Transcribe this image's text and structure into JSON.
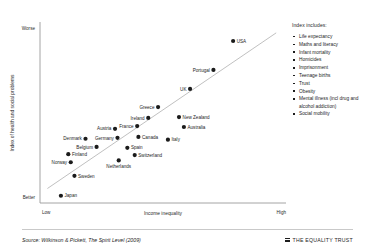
{
  "chart_data": {
    "type": "scatter",
    "title": "",
    "xlabel": "Income inequality",
    "ylabel": "Index of health and social problems",
    "x_tick_labels": [
      "Low",
      "High"
    ],
    "y_tick_labels": [
      "Worse",
      "Better"
    ],
    "grid": false,
    "legend_position": "right",
    "xlim": [
      0,
      100
    ],
    "ylim": [
      0,
      100
    ],
    "trendline": {
      "x0": 3,
      "y0": 8,
      "x1": 96,
      "y1": 94
    },
    "points": [
      {
        "name": "USA",
        "x": 78.5,
        "y": 89.5,
        "label_side": "right"
      },
      {
        "name": "Portugal",
        "x": 70.5,
        "y": 73.5,
        "label_side": "left"
      },
      {
        "name": "UK",
        "x": 61.0,
        "y": 63.0,
        "label_side": "left"
      },
      {
        "name": "Greece",
        "x": 48.0,
        "y": 53.0,
        "label_side": "left"
      },
      {
        "name": "New Zealand",
        "x": 56.5,
        "y": 47.5,
        "label_side": "right"
      },
      {
        "name": "Ireland",
        "x": 44.0,
        "y": 47.0,
        "label_side": "left"
      },
      {
        "name": "Australia",
        "x": 58.5,
        "y": 42.0,
        "label_side": "right"
      },
      {
        "name": "Austria",
        "x": 30.5,
        "y": 41.0,
        "label_side": "left"
      },
      {
        "name": "France",
        "x": 39.5,
        "y": 42.5,
        "label_side": "left"
      },
      {
        "name": "Canada",
        "x": 40.0,
        "y": 36.5,
        "label_side": "right"
      },
      {
        "name": "Germany",
        "x": 31.5,
        "y": 36.0,
        "label_side": "left"
      },
      {
        "name": "Denmark",
        "x": 18.5,
        "y": 35.5,
        "label_side": "left"
      },
      {
        "name": "Italy",
        "x": 52.0,
        "y": 35.0,
        "label_side": "right"
      },
      {
        "name": "Belgium",
        "x": 23.0,
        "y": 31.0,
        "label_side": "left"
      },
      {
        "name": "Spain",
        "x": 35.5,
        "y": 30.5,
        "label_side": "right"
      },
      {
        "name": "Switzerland",
        "x": 38.5,
        "y": 26.5,
        "label_side": "right"
      },
      {
        "name": "Finland",
        "x": 11.5,
        "y": 27.0,
        "label_side": "right"
      },
      {
        "name": "Netherlands",
        "x": 32.0,
        "y": 23.5,
        "label_side": "below"
      },
      {
        "name": "Norway",
        "x": 12.5,
        "y": 22.5,
        "label_side": "left"
      },
      {
        "name": "Sweden",
        "x": 14.0,
        "y": 15.0,
        "label_side": "right"
      },
      {
        "name": "Japan",
        "x": 8.5,
        "y": 4.0,
        "label_side": "right"
      }
    ]
  },
  "legend": {
    "title": "Index includes:",
    "items": [
      "Life expectancy",
      "Maths and literacy",
      "Infant mortality",
      "Homicides",
      "Imprisonment",
      "Teenage births",
      "Trust",
      "Obesity",
      "Mental illness (incl drug and alcohol addiction)",
      "Social mobility"
    ]
  },
  "footer": {
    "source": "Source: Wilkinson & Pickett, The Spirit Level (2009)",
    "brand": "THE EQUALITY TRUST",
    "brand_icon": "hamburger-bars-icon"
  },
  "colors": {
    "point": "#1b1b1b",
    "axis": "#9a9a9a",
    "trend": "#b9b9b9",
    "text": "#1d1d1d"
  }
}
